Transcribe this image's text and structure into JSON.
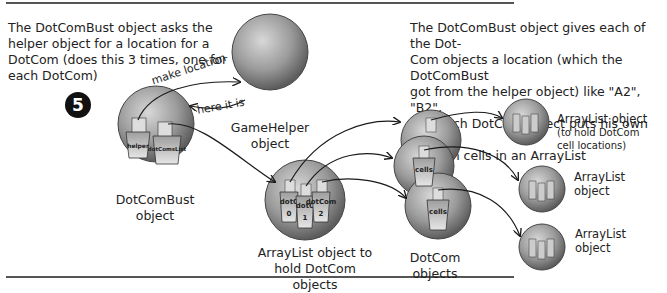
{
  "step_number": "5",
  "left_description": [
    "The DotComBust object asks the",
    "helper object for a location for a",
    "DotCom (does this 3 times, one for",
    "each DotCom)"
  ],
  "right_description": [
    "The DotComBust object gives each of the Dot-",
    "Com objects a location (which the DotComBust",
    "got from the helper object) like \"A2\", \"B2\",",
    "etc.  Each DotCom object puts his own three",
    "location cells in an ArrayList"
  ],
  "arrows": {
    "make_location": "make location",
    "here_it_is": "here it is"
  },
  "objects": {
    "dotcombust": {
      "caption": [
        "DotComBust",
        "object"
      ],
      "cups": [
        "helper",
        "dotComsList"
      ]
    },
    "gamehelper": {
      "caption": [
        "GameHelper",
        "object"
      ]
    },
    "arraylist_dotcoms": {
      "caption": [
        "ArrayList object to",
        "hold DotCom objects"
      ],
      "cups": [
        "dotCom 0",
        "dotCom 1",
        "dotCom 2"
      ]
    },
    "dotcoms": {
      "caption": [
        "DotCom",
        "objects"
      ],
      "cup_label": "cells"
    },
    "arraylist_cells": [
      {
        "caption": [
          "ArrayList object",
          "(to hold DotCom",
          "cell locations)"
        ]
      },
      {
        "caption": [
          "ArrayList",
          "object"
        ]
      },
      {
        "caption": [
          "ArrayList",
          "object"
        ]
      }
    ]
  },
  "colors": {
    "sphere": "#8a8a8a",
    "sphere_light": "#cfcfcf",
    "ink": "#1a1a1a"
  }
}
